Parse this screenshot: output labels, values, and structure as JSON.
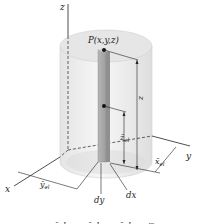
{
  "figure": {
    "axes": {
      "x": "x",
      "y": "y",
      "z": "z"
    },
    "point_label": "P(x,y,z)",
    "dimension_labels": {
      "z": "z",
      "z_el": "z̄",
      "z_el_sub": "el",
      "x_el": "x̄",
      "x_el_sub": "el",
      "y_el": "ȳ",
      "y_el_sub": "el",
      "dx": "dx",
      "dy": "dy"
    },
    "caption_partial": "x̄el = x,  ȳel = y,  z̄el = z/2",
    "colors": {
      "cylinder_fill": "#ececec",
      "cylinder_top": "#e2e2e2",
      "element_fill": "#a9a9a9",
      "element_side": "#8c8c8c",
      "line": "#222222"
    }
  }
}
